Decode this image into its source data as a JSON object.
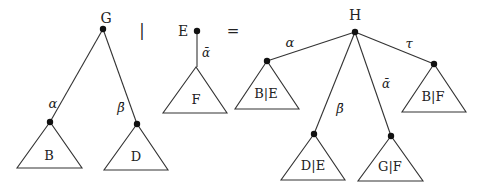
{
  "operators": {
    "bar": "|",
    "equals": "="
  },
  "left_tree": {
    "root_label": "G",
    "children": [
      {
        "edge_label": "α",
        "subtree": "B"
      },
      {
        "edge_label": "β̄",
        "subtree": "D"
      }
    ]
  },
  "middle_tree": {
    "root_label": "E",
    "children": [
      {
        "edge_label": "ᾱ",
        "subtree": "F"
      }
    ]
  },
  "result_tree": {
    "root_label": "H",
    "children": [
      {
        "edge_label": "α",
        "subtree": "B|E"
      },
      {
        "edge_label": "β̄",
        "subtree": "D|E"
      },
      {
        "edge_label": "ᾱ",
        "subtree": "G|F"
      },
      {
        "edge_label": "τ",
        "subtree": "B|F"
      }
    ]
  }
}
